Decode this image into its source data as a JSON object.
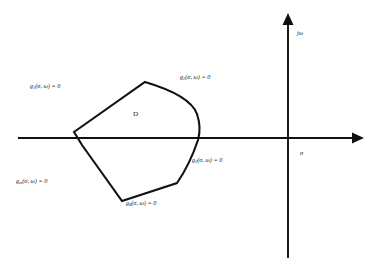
{
  "figure": {
    "background_color": "#ffffff",
    "line_color": "#111111",
    "text_color": "#1a1a1a"
  },
  "axes": {
    "horizontal": {
      "name": "real-axis",
      "label": "σ",
      "label_full": "sigma",
      "y": 138,
      "x_start": 18,
      "x_end": 360,
      "arrow": "right"
    },
    "vertical": {
      "name": "imaginary-axis",
      "label": "jω",
      "label_full": "j omega",
      "x": 288,
      "y_start": 258,
      "y_end": 16,
      "arrow": "up"
    },
    "origin": {
      "x": 288,
      "y": 138
    }
  },
  "region": {
    "name": "region-D",
    "label": "D",
    "label_x": 133,
    "label_y": 114,
    "vertices": [
      {
        "x": 74,
        "y": 132
      },
      {
        "x": 145,
        "y": 82
      },
      {
        "x": 196,
        "y": 106
      },
      {
        "x": 200,
        "y": 138
      },
      {
        "x": 177,
        "y": 183
      },
      {
        "x": 122,
        "y": 201
      },
      {
        "x": 82,
        "y": 145
      }
    ]
  },
  "constraints": [
    {
      "id": "g1",
      "name": "constraint-g1",
      "base": "g",
      "subscript": "1",
      "args": "(σ, ω) = 0",
      "text": "g₁(σ, ω) = 0",
      "x": 30,
      "y": 85
    },
    {
      "id": "g2",
      "name": "constraint-g2",
      "base": "g",
      "subscript": "2",
      "args": "(σ, ω) = 0",
      "text": "g₂(σ, ω) = 0",
      "x": 180,
      "y": 76
    },
    {
      "id": "g3",
      "name": "constraint-g3",
      "base": "g",
      "subscript": "3",
      "args": "(σ, ω) = 0",
      "text": "g₃(σ, ω) = 0",
      "x": 192,
      "y": 159
    },
    {
      "id": "g4",
      "name": "constraint-g4",
      "base": "g",
      "subscript": "4",
      "args": "(σ, ω) = 0",
      "text": "g₄(σ, ω) = 0",
      "x": 126,
      "y": 202
    },
    {
      "id": "gm",
      "name": "constraint-gm",
      "base": "g",
      "subscript": "m",
      "args": "(σ, ω) = 0",
      "text": "gₘ(σ, ω) = 0",
      "x": 16,
      "y": 180
    }
  ]
}
